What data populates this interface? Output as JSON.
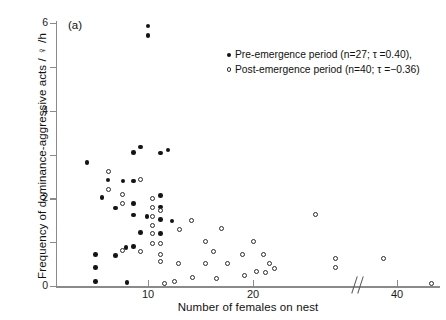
{
  "figure": {
    "panel_label": "(a)",
    "background": "#ffffff",
    "marker_filled_color": "#141414",
    "marker_open_color": "#2a2a2a"
  },
  "legend": {
    "position": "top-right",
    "entries": [
      {
        "marker": "filled-circle",
        "label": "Pre-emergence period (n=27; τ =0.40),"
      },
      {
        "marker": "open-circle",
        "label": "Post-emergence period (n=40; τ =−0.36)"
      }
    ]
  },
  "axes": {
    "y_ticks": [
      {
        "value": 0,
        "label": "0"
      },
      {
        "value": 1,
        "label": ""
      },
      {
        "value": 2,
        "label": "2"
      },
      {
        "value": 3,
        "label": ""
      },
      {
        "value": 4,
        "label": "4"
      },
      {
        "value": 5,
        "label": ""
      },
      {
        "value": 6,
        "label": "6"
      }
    ],
    "x_ticks": [
      {
        "value": 10,
        "label": "10"
      },
      {
        "value": 20,
        "label": "20"
      },
      {
        "value": 40,
        "label": "40"
      }
    ],
    "x_break": true,
    "x_break_label": "//"
  },
  "chart_data": {
    "type": "scatter",
    "title": "",
    "subtitle": "",
    "panel": "(a)",
    "xlabel": "Number of females on nest",
    "ylabel": "Frequency of dominance-aggressive acts / ♀ /h",
    "xlim": [
      1.3,
      47
    ],
    "ylim": [
      0,
      6.15
    ],
    "grid": false,
    "x_axis_break": {
      "between": [
        26,
        36
      ],
      "style": "double-slash"
    },
    "annotations": [
      {
        "text": "(a)",
        "x": 2.5,
        "y": 5.95
      }
    ],
    "legend_position": "top-right",
    "series": [
      {
        "name": "Pre-emergence period",
        "n": 27,
        "tau": 0.4,
        "marker": "filled-circle",
        "color": "#141414",
        "points": [
          [
            10.0,
            5.93
          ],
          [
            10.0,
            5.72
          ],
          [
            8.6,
            3.05
          ],
          [
            9.3,
            3.17
          ],
          [
            11.2,
            3.03
          ],
          [
            11.9,
            3.1
          ],
          [
            4.2,
            2.82
          ],
          [
            6.2,
            2.42
          ],
          [
            7.6,
            2.4
          ],
          [
            8.6,
            2.4
          ],
          [
            5.6,
            2.02
          ],
          [
            11.2,
            2.07
          ],
          [
            8.6,
            1.88
          ],
          [
            6.9,
            1.78
          ],
          [
            11.2,
            1.8
          ],
          [
            8.6,
            1.62
          ],
          [
            9.9,
            1.58
          ],
          [
            11.2,
            1.52
          ],
          [
            12.3,
            1.48
          ],
          [
            9.3,
            1.22
          ],
          [
            11.2,
            1.2
          ],
          [
            7.9,
            0.88
          ],
          [
            8.6,
            0.9
          ],
          [
            5.0,
            0.72
          ],
          [
            6.9,
            0.7
          ],
          [
            5.0,
            0.42
          ],
          [
            5.0,
            0.1
          ],
          [
            8.0,
            0.08
          ]
        ]
      },
      {
        "name": "Post-emergence period",
        "n": 40,
        "tau": -0.36,
        "marker": "open-circle",
        "color": "#2a2a2a",
        "points": [
          [
            6.2,
            2.62
          ],
          [
            6.2,
            2.2
          ],
          [
            9.3,
            2.42
          ],
          [
            7.6,
            2.08
          ],
          [
            7.6,
            1.88
          ],
          [
            10.4,
            2.0
          ],
          [
            10.4,
            1.78
          ],
          [
            10.4,
            1.58
          ],
          [
            10.4,
            1.38
          ],
          [
            10.4,
            1.2
          ],
          [
            11.2,
            1.72
          ],
          [
            14.1,
            1.5
          ],
          [
            13.0,
            1.28
          ],
          [
            10.4,
            0.98
          ],
          [
            11.2,
            0.98
          ],
          [
            7.6,
            0.82
          ],
          [
            9.3,
            0.78
          ],
          [
            11.2,
            0.72
          ],
          [
            11.2,
            0.55
          ],
          [
            12.9,
            0.52
          ],
          [
            15.5,
            1.02
          ],
          [
            15.5,
            0.52
          ],
          [
            17.0,
            1.32
          ],
          [
            16.2,
            0.78
          ],
          [
            17.6,
            0.52
          ],
          [
            19.0,
            0.72
          ],
          [
            20.0,
            1.02
          ],
          [
            21.0,
            0.72
          ],
          [
            21.6,
            0.52
          ],
          [
            22.0,
            0.4
          ],
          [
            20.3,
            0.32
          ],
          [
            21.2,
            0.3
          ],
          [
            19.2,
            0.24
          ],
          [
            14.2,
            0.2
          ],
          [
            16.5,
            0.18
          ],
          [
            12.5,
            0.1
          ],
          [
            11.6,
            0.05
          ],
          [
            29.2,
            1.62
          ],
          [
            31.8,
            0.62
          ],
          [
            31.8,
            0.42
          ],
          [
            38.2,
            0.62
          ],
          [
            44.5,
            0.06
          ]
        ]
      }
    ]
  }
}
